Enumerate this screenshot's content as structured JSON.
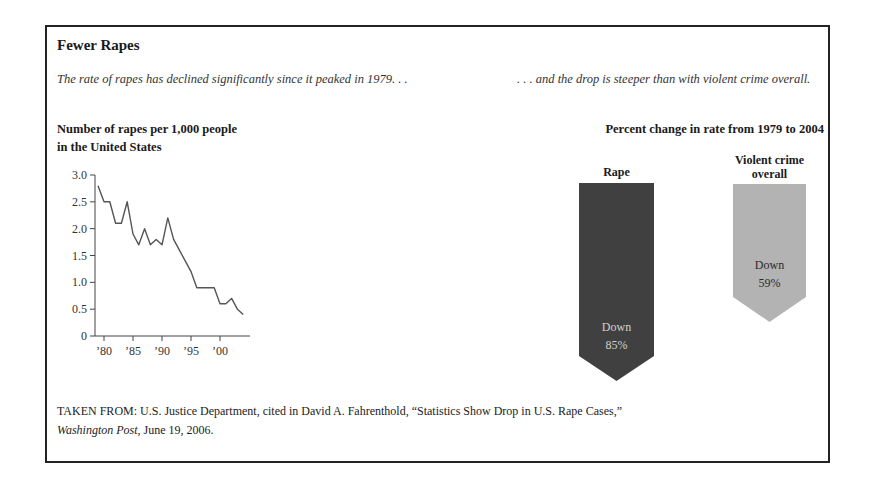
{
  "figure": {
    "title": "Fewer Rapes",
    "lede_left": "The rate of rapes has declined significantly since it peaked in 1979. . .",
    "lede_right": ". . . and the drop is steeper than with violent crime overall.",
    "source_prefix": "TAKEN FROM: U.S. Justice Department, cited in David A. Fahrenthold, “Statistics Show Drop in U.S. Rape Cases,”",
    "source_publication": "Washington Post",
    "source_suffix": ", June 19, 2006."
  },
  "chart_data": [
    {
      "type": "line",
      "title": "Number of rapes per 1,000 people in the United States",
      "title_lines": [
        "Number of rapes per 1,000 people",
        "in the United States"
      ],
      "xlabel": "",
      "ylabel": "",
      "x": [
        1979,
        1980,
        1981,
        1982,
        1983,
        1984,
        1985,
        1986,
        1987,
        1988,
        1989,
        1990,
        1991,
        1992,
        1993,
        1994,
        1995,
        1996,
        1997,
        1998,
        1999,
        2000,
        2001,
        2002,
        2003,
        2004
      ],
      "values": [
        2.8,
        2.5,
        2.5,
        2.1,
        2.1,
        2.5,
        1.9,
        1.7,
        2.0,
        1.7,
        1.8,
        1.7,
        2.2,
        1.8,
        1.6,
        1.4,
        1.2,
        0.9,
        0.9,
        0.9,
        0.9,
        0.6,
        0.6,
        0.7,
        0.5,
        0.4
      ],
      "ylim": [
        0,
        3.0
      ],
      "yticks": [
        "0",
        "0.5",
        "1.0",
        "1.5",
        "2.0",
        "2.5",
        "3.0"
      ],
      "xticks": [
        "’80",
        "’85",
        "’90",
        "’95",
        "’00"
      ],
      "xtick_years": [
        1980,
        1985,
        1990,
        1995,
        2000
      ],
      "grid": false,
      "line_color": "#555555"
    },
    {
      "type": "bar",
      "title": "Percent change in rate from 1979 to 2004",
      "categories": [
        "Rape",
        "Violent crime overall"
      ],
      "category_label_lines": [
        [
          "Rape"
        ],
        [
          "Violent crime",
          "overall"
        ]
      ],
      "values": [
        -85,
        -59
      ],
      "value_labels": [
        [
          "Down",
          "85%"
        ],
        [
          "Down",
          "59%"
        ]
      ],
      "colors": [
        "#404040",
        "#b3b3b3"
      ],
      "text_colors": [
        "#d0d0d0",
        "#2a2a2a"
      ],
      "style": "downward arrows"
    }
  ]
}
